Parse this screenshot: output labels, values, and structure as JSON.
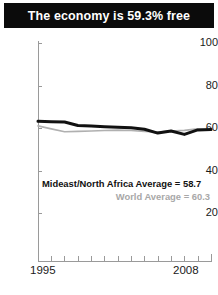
{
  "title": {
    "text": "The economy is 59.3% free"
  },
  "annotations": {
    "region_average": "Mideast/North Africa Average = 58.7",
    "world_average": "World Average = 60.3"
  },
  "colors": {
    "title_background": "#0b0b0b",
    "title_text": "#ffffff",
    "region_line": "#111111",
    "world_line": "#b0b0b0",
    "axis": "#9a9a9a",
    "tick_text": "#1a1a1a"
  },
  "axis": {
    "y_ticks": [
      "100",
      "80",
      "60",
      "40",
      "20"
    ],
    "x_start": "1995",
    "x_end": "2008"
  },
  "chart_data": {
    "type": "line",
    "title": "The economy is 59.3% free",
    "xlabel": "",
    "ylabel": "",
    "xlim": [
      1995,
      2008
    ],
    "ylim": [
      0,
      100
    ],
    "y_ticks": [
      20,
      40,
      60,
      80,
      100
    ],
    "x_ticks": [
      1995,
      1996,
      1997,
      1998,
      1999,
      2000,
      2001,
      2002,
      2003,
      2004,
      2005,
      2006,
      2007,
      2008
    ],
    "grid": false,
    "legend": "none",
    "x": [
      1995,
      1996,
      1997,
      1998,
      1999,
      2000,
      2001,
      2002,
      2003,
      2004,
      2005,
      2006,
      2007,
      2008
    ],
    "series": [
      {
        "name": "Mideast/North Africa Average",
        "color": "#111111",
        "values": [
          63.2,
          63.0,
          62.8,
          61.2,
          60.9,
          60.6,
          60.4,
          60.1,
          59.4,
          57.6,
          58.6,
          57.0,
          59.1,
          59.3
        ]
      },
      {
        "name": "World Average",
        "color": "#b0b0b0",
        "values": [
          61.0,
          59.6,
          58.2,
          58.4,
          58.6,
          58.8,
          59.0,
          58.8,
          58.4,
          58.1,
          58.6,
          58.9,
          59.6,
          59.0
        ]
      }
    ],
    "annotations": [
      {
        "text": "Mideast/North Africa Average = 58.7",
        "value": 58.7,
        "color": "#111111"
      },
      {
        "text": "World Average = 60.3",
        "value": 60.3,
        "color": "#a8a8a8"
      }
    ]
  }
}
